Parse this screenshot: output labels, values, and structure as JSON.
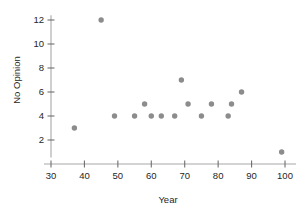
{
  "chart_data": {
    "type": "scatter",
    "title": "",
    "xlabel": "Year",
    "ylabel": "No Opinion",
    "xlim": [
      28,
      106
    ],
    "ylim": [
      0,
      13
    ],
    "grid": false,
    "legend": null,
    "marker_color": "#8c8c8c",
    "axis_color": "#a8a8a8",
    "text_color": "#262626",
    "xticks": [
      30,
      40,
      50,
      60,
      70,
      80,
      90,
      100
    ],
    "yticks": [
      2,
      4,
      6,
      8,
      10,
      12
    ],
    "x": [
      37,
      45,
      49,
      55,
      58,
      60,
      63,
      67,
      69,
      71,
      75,
      78,
      83,
      84,
      87,
      99
    ],
    "y": [
      3,
      12,
      4,
      4,
      5,
      4,
      4,
      4,
      7,
      5,
      4,
      5,
      4,
      5,
      6,
      1
    ],
    "points": [
      {
        "x": 37,
        "y": 3
      },
      {
        "x": 45,
        "y": 12
      },
      {
        "x": 49,
        "y": 4
      },
      {
        "x": 55,
        "y": 4
      },
      {
        "x": 58,
        "y": 5
      },
      {
        "x": 60,
        "y": 4
      },
      {
        "x": 63,
        "y": 4
      },
      {
        "x": 67,
        "y": 4
      },
      {
        "x": 69,
        "y": 7
      },
      {
        "x": 71,
        "y": 5
      },
      {
        "x": 75,
        "y": 4
      },
      {
        "x": 78,
        "y": 5
      },
      {
        "x": 83,
        "y": 4
      },
      {
        "x": 84,
        "y": 5
      },
      {
        "x": 87,
        "y": 6
      },
      {
        "x": 99,
        "y": 1
      }
    ]
  },
  "axes": {
    "x_title": "Year",
    "y_title": "No Opinion",
    "x_tick_labels": [
      "30",
      "40",
      "50",
      "60",
      "70",
      "80",
      "90",
      "100"
    ],
    "y_tick_labels": [
      "2",
      "4",
      "6",
      "8",
      "10",
      "12"
    ]
  }
}
